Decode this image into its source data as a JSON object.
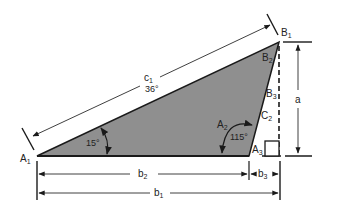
{
  "diagram": {
    "colors": {
      "triangle_fill": "#8f8f8f",
      "line": "#1a1a1a",
      "dim_line": "#2a2a2a",
      "background": "#ffffff"
    },
    "vertices": {
      "A1": {
        "base": "A",
        "sub": "1"
      },
      "B1": {
        "base": "B",
        "sub": "1"
      },
      "B2": {
        "base": "B",
        "sub": "2"
      },
      "B3": {
        "base": "B",
        "sub": "3"
      },
      "C2": {
        "base": "C",
        "sub": "2"
      },
      "A2": {
        "base": "A",
        "sub": "2"
      },
      "A3": {
        "base": "A",
        "sub": "3"
      }
    },
    "dimensions": {
      "c1": {
        "base": "c",
        "sub": "1"
      },
      "a": {
        "base": "a"
      },
      "b1": {
        "base": "b",
        "sub": "1"
      },
      "b2": {
        "base": "b",
        "sub": "2"
      },
      "b3": {
        "base": "b",
        "sub": "3"
      }
    },
    "angles": {
      "c1_angle": "36°",
      "A1_angle": "15°",
      "A2_angle": "115°"
    }
  }
}
